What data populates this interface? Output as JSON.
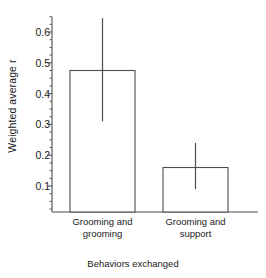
{
  "chart_data": {
    "type": "bar",
    "title": "",
    "xlabel": "Behaviors exchanged",
    "ylabel": "Weighted average r",
    "categories": [
      "Grooming and grooming",
      "Grooming and support"
    ],
    "category_lines": [
      [
        "Grooming and",
        "grooming"
      ],
      [
        "Grooming and",
        "support"
      ]
    ],
    "values": [
      0.475,
      0.16
    ],
    "errors_low": [
      0.31,
      0.09
    ],
    "errors_high": [
      0.645,
      0.24
    ],
    "series": [
      {
        "name": "Weighted average r",
        "values": [
          0.475,
          0.16
        ]
      }
    ],
    "ylim": [
      0.0,
      0.65
    ],
    "ytick_values": [
      0.1,
      0.2,
      0.3,
      0.4,
      0.5,
      0.6
    ],
    "ytick_labels": [
      "0.1",
      "0.2",
      "0.3",
      "0.4",
      "0.5",
      "0.6"
    ],
    "yminor_step": 0.025,
    "grid": false,
    "legend": "none",
    "error_bar_caps": false,
    "bar_fill": "#ffffff",
    "bar_stroke": "#4d4d4d",
    "axis_color": "#4d4d4d",
    "text_color": "#1a1a1a"
  }
}
